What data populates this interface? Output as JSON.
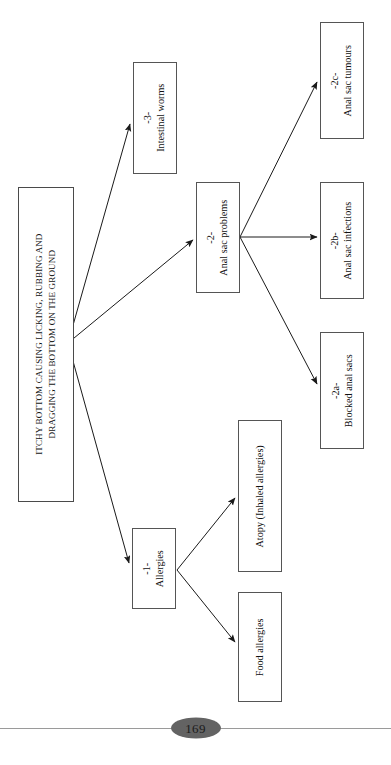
{
  "page": {
    "number": "169",
    "orientation": "rotated-90-ccw"
  },
  "diagram": {
    "root": {
      "label": "ITCHY BOTTOM CAUSING LICKING, RUBBING AND DRAGGING THE BOTTOM ON THE GROUND",
      "line1": "ITCHY BOTTOM CAUSING LICKING, RUBBING AND",
      "line2": "DRAGGING THE BOTTOM ON THE GROUND"
    },
    "nodes": [
      {
        "id": "worms",
        "code": "-3-",
        "label": "Intestinal worms"
      },
      {
        "id": "anal_sac",
        "code": "-2-",
        "label": "Anal sac problems"
      },
      {
        "id": "allergies",
        "code": "-1-",
        "label": "Allergies"
      },
      {
        "id": "tumours",
        "code": "-2c-",
        "label": "Anal sac tumours"
      },
      {
        "id": "infections",
        "code": "-2b-",
        "label": "Anal sac infections"
      },
      {
        "id": "blocked",
        "code": "-2a-",
        "label": "Blocked anal sacs"
      },
      {
        "id": "atopy",
        "code": "",
        "label": "Atopy (Inhaled allergies)"
      },
      {
        "id": "food",
        "code": "",
        "label": "Food allergies"
      }
    ],
    "edges": [
      {
        "from": "root",
        "to": "worms"
      },
      {
        "from": "root",
        "to": "anal_sac"
      },
      {
        "from": "root",
        "to": "allergies"
      },
      {
        "from": "anal_sac",
        "to": "tumours"
      },
      {
        "from": "anal_sac",
        "to": "infections"
      },
      {
        "from": "anal_sac",
        "to": "blocked"
      },
      {
        "from": "allergies",
        "to": "atopy"
      },
      {
        "from": "allergies",
        "to": "food"
      }
    ],
    "colors": {
      "box_border": "#555555",
      "box_fill": "#ffffff",
      "arrow": "#1a1a1a",
      "page_badge": "#636363",
      "rule": "#9a9a9a"
    }
  }
}
